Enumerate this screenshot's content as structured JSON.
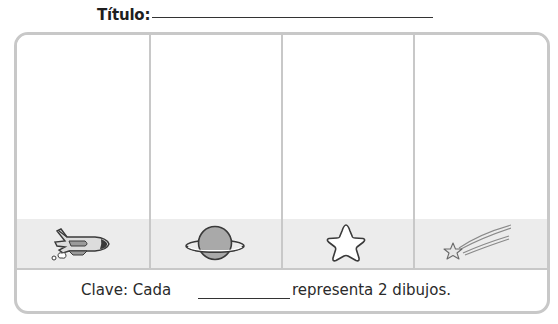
{
  "header": {
    "title_label": "Título:",
    "title_value": ""
  },
  "pictograph": {
    "categories": [
      {
        "label": "shuttle",
        "icon": "space-shuttle-icon"
      },
      {
        "label": "planet",
        "icon": "planet-icon"
      },
      {
        "label": "star",
        "icon": "star-icon"
      },
      {
        "label": "shooting star",
        "icon": "shooting-star-icon"
      }
    ],
    "colors": {
      "border": "#c8c8c8",
      "label_band": "#ececec",
      "planet_fill": "#a9a9a9",
      "shuttle_fill": "#dcdcdc",
      "outline": "#3a3a3a"
    }
  },
  "key": {
    "prefix": "Clave: Cada",
    "blank_value": "",
    "suffix": "representa 2 dibujos."
  }
}
